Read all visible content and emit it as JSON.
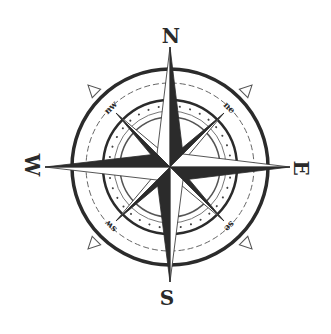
{
  "image": {
    "subject": "compass rose",
    "background": "#ffffff",
    "ink_dark": "#2b2b2b",
    "ink_light": "#ffffff"
  },
  "labels": {
    "north": "N",
    "east": "E",
    "south": "S",
    "west": "W",
    "northeast": "ne",
    "southeast": "se",
    "southwest": "sw",
    "northwest": "nw"
  }
}
